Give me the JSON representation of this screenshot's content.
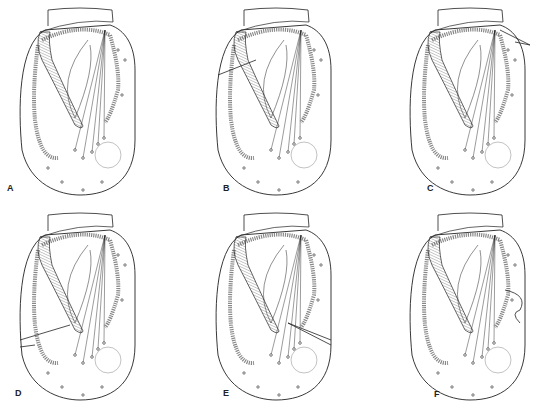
{
  "figure": {
    "panels": [
      {
        "id": "A",
        "label": "A",
        "x": 0,
        "y": 0,
        "notch": "none",
        "label_pos": [
          7,
          191
        ]
      },
      {
        "id": "B",
        "label": "B",
        "x": 186,
        "y": 0,
        "notch": "left-upper",
        "label_pos": [
          37,
          191
        ]
      },
      {
        "id": "C",
        "label": "C",
        "x": 372,
        "y": 0,
        "notch": "right-top",
        "label_pos": [
          55,
          191
        ]
      },
      {
        "id": "D",
        "label": "D",
        "x": 0,
        "y": 205,
        "notch": "left-lower",
        "label_pos": [
          15,
          191
        ]
      },
      {
        "id": "E",
        "label": "E",
        "x": 186,
        "y": 205,
        "notch": "right-middle",
        "label_pos": [
          37,
          191
        ]
      },
      {
        "id": "F",
        "label": "F",
        "x": 372,
        "y": 205,
        "notch": "right-middle-lobe",
        "label_pos": [
          62,
          192
        ]
      }
    ],
    "colors": {
      "line": "#222222",
      "beads": "#888888",
      "hatch": "#555555"
    }
  }
}
